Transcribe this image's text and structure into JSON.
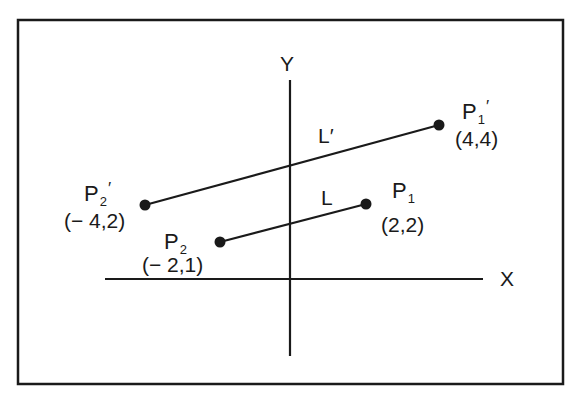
{
  "diagram": {
    "type": "coordinate-transformation",
    "axes": {
      "x_label": "X",
      "y_label": "Y"
    },
    "lines": [
      {
        "name": "L",
        "from": "P2",
        "to": "P1"
      },
      {
        "name": "L′",
        "from": "P2′",
        "to": "P1′"
      }
    ],
    "labels": {
      "L": "L",
      "L_prime": "L′",
      "P1": {
        "base": "P",
        "sub": "1",
        "prime": "",
        "coords": "(2,2)"
      },
      "P2": {
        "base": "P",
        "sub": "2",
        "prime": "",
        "coords": "(− 2,1)"
      },
      "P1_prime": {
        "base": "P",
        "sub": "1",
        "prime": "′",
        "coords": "(4,4)"
      },
      "P2_prime": {
        "base": "P",
        "sub": "2",
        "prime": "′",
        "coords": "(− 4,2)"
      }
    },
    "points": [
      {
        "name": "P1",
        "x": 2,
        "y": 2
      },
      {
        "name": "P2",
        "x": -2,
        "y": 1
      },
      {
        "name": "P1′",
        "x": 4,
        "y": 4
      },
      {
        "name": "P2′",
        "x": -4,
        "y": 2
      }
    ],
    "colors": {
      "ink": "#1a1a1a",
      "background": "#ffffff"
    }
  }
}
